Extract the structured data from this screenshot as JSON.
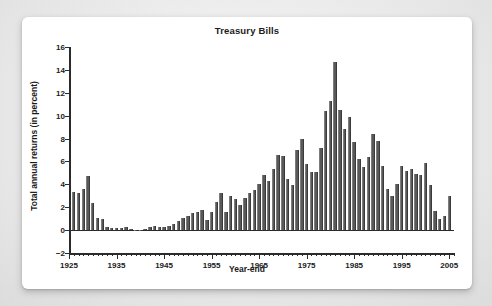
{
  "card": {
    "background": "#ffffff",
    "page_background": "#ececec"
  },
  "chart_data": {
    "type": "bar",
    "title": "Treasury Bills",
    "xlabel": "Year-end",
    "ylabel": "Total annual returns (in percent)",
    "ylim": [
      -2,
      16
    ],
    "yticks": [
      -2,
      0,
      2,
      4,
      6,
      8,
      10,
      12,
      14,
      16
    ],
    "ytick_labels": [
      "−2",
      "0",
      "2",
      "4",
      "6",
      "8",
      "10",
      "12",
      "14",
      "16"
    ],
    "xlim": [
      1925,
      2006
    ],
    "xticks": [
      1925,
      1935,
      1945,
      1955,
      1965,
      1975,
      1985,
      1995,
      2005
    ],
    "xtick_labels": [
      "1925",
      "1935",
      "1945",
      "1955",
      "1965",
      "1975",
      "1985",
      "1995",
      "2005"
    ],
    "grid": false,
    "legend": false,
    "bar_color": "#595959",
    "axis_color": "#2b2b2b",
    "categories": [
      1926,
      1927,
      1928,
      1929,
      1930,
      1931,
      1932,
      1933,
      1934,
      1935,
      1936,
      1937,
      1938,
      1939,
      1940,
      1941,
      1942,
      1943,
      1944,
      1945,
      1946,
      1947,
      1948,
      1949,
      1950,
      1951,
      1952,
      1953,
      1954,
      1955,
      1956,
      1957,
      1958,
      1959,
      1960,
      1961,
      1962,
      1963,
      1964,
      1965,
      1966,
      1967,
      1968,
      1969,
      1970,
      1971,
      1972,
      1973,
      1974,
      1975,
      1976,
      1977,
      1978,
      1979,
      1980,
      1981,
      1982,
      1983,
      1984,
      1985,
      1986,
      1987,
      1988,
      1989,
      1990,
      1991,
      1992,
      1993,
      1994,
      1995,
      1996,
      1997,
      1998,
      1999,
      2000,
      2001,
      2002,
      2003,
      2004,
      2005
    ],
    "values": [
      3.3,
      3.2,
      3.6,
      4.7,
      2.4,
      1.1,
      1.0,
      0.3,
      0.2,
      0.2,
      0.2,
      0.3,
      0.1,
      0.0,
      0.0,
      0.1,
      0.3,
      0.4,
      0.3,
      0.3,
      0.4,
      0.5,
      0.8,
      1.1,
      1.2,
      1.5,
      1.6,
      1.8,
      0.9,
      1.6,
      2.5,
      3.2,
      1.6,
      3.0,
      2.7,
      2.2,
      2.8,
      3.2,
      3.5,
      4.0,
      4.8,
      4.3,
      5.3,
      6.6,
      6.5,
      4.5,
      3.9,
      7.0,
      8.0,
      5.8,
      5.1,
      5.1,
      7.2,
      10.4,
      11.3,
      14.7,
      10.5,
      8.8,
      9.9,
      7.7,
      6.2,
      5.5,
      6.4,
      8.4,
      7.8,
      5.6,
      3.6,
      3.0,
      4.0,
      5.6,
      5.2,
      5.3,
      4.9,
      4.8,
      5.9,
      3.9,
      1.7,
      1.0,
      1.2,
      3.0
    ],
    "series_name": "Total annual returns"
  }
}
